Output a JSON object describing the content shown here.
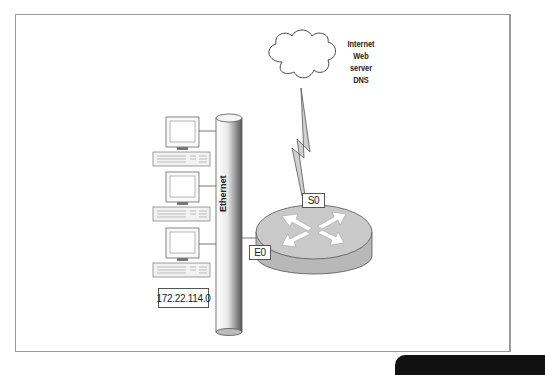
{
  "diagram": {
    "title": "",
    "cloud": {
      "lines": [
        "Internet",
        "Web server",
        "DNS"
      ]
    },
    "segment": {
      "label": "Ethernet",
      "network_address": "172.22.114.0",
      "host_count": 3
    },
    "router": {
      "interfaces": [
        {
          "name": "S0",
          "connects_to": "Internet cloud (serial / WAN link)"
        },
        {
          "name": "E0",
          "connects_to": "Ethernet segment"
        }
      ]
    },
    "nodes": [
      {
        "id": "pc1",
        "type": "workstation"
      },
      {
        "id": "pc2",
        "type": "workstation"
      },
      {
        "id": "pc3",
        "type": "workstation"
      },
      {
        "id": "ethernet",
        "type": "bus",
        "label": "Ethernet"
      },
      {
        "id": "router",
        "type": "router"
      },
      {
        "id": "cloud",
        "type": "cloud",
        "label": "Internet / Web server / DNS"
      }
    ],
    "edges": [
      {
        "from": "pc1",
        "to": "ethernet"
      },
      {
        "from": "pc2",
        "to": "ethernet"
      },
      {
        "from": "pc3",
        "to": "ethernet"
      },
      {
        "from": "ethernet",
        "to": "router",
        "via": "E0"
      },
      {
        "from": "router",
        "to": "cloud",
        "via": "S0",
        "style": "lightning"
      }
    ]
  },
  "colors": {
    "frame_border": "#9a9a9a",
    "router_fill": "#b8b8b8",
    "router_top": "#c9c9c9",
    "stroke": "#444444",
    "footer_tab": "#111111"
  }
}
